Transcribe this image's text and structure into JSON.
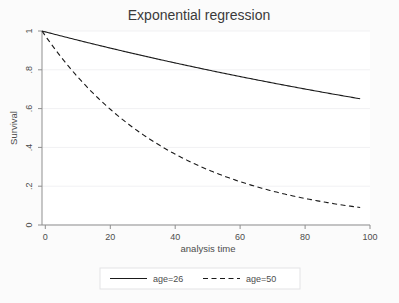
{
  "chart_data": {
    "type": "line",
    "title": "Exponential regression",
    "xlabel": "analysis time",
    "ylabel": "Survival",
    "xlim": [
      0,
      100
    ],
    "ylim": [
      0,
      1
    ],
    "xticks": [
      0,
      20,
      40,
      60,
      80,
      100
    ],
    "xtick_labels": [
      "0",
      "20",
      "40",
      "60",
      "80",
      "100"
    ],
    "yticks": [
      0,
      0.2,
      0.4,
      0.6,
      0.8,
      1
    ],
    "ytick_labels": [
      "0",
      ".2",
      ".4",
      ".6",
      ".8",
      "1"
    ],
    "grid": "horizontal",
    "legend_position": "bottom",
    "series": [
      {
        "name": "age=26",
        "style": "solid",
        "color": "#1a1a1a",
        "model": "exponential survival",
        "hazard": 0.00443,
        "x": [
          0,
          5,
          10,
          15,
          20,
          25,
          30,
          35,
          40,
          45,
          50,
          55,
          60,
          65,
          70,
          75,
          80,
          85,
          90,
          97
        ],
        "values": [
          1.0,
          0.978,
          0.957,
          0.936,
          0.915,
          0.895,
          0.876,
          0.857,
          0.838,
          0.82,
          0.802,
          0.784,
          0.767,
          0.75,
          0.734,
          0.718,
          0.702,
          0.687,
          0.672,
          0.65
        ]
      },
      {
        "name": "age=50",
        "style": "dashed",
        "color": "#1a1a1a",
        "model": "exponential survival",
        "hazard": 0.02481,
        "x": [
          0,
          5,
          10,
          15,
          20,
          25,
          30,
          35,
          40,
          45,
          50,
          55,
          60,
          65,
          70,
          75,
          80,
          85,
          90,
          97
        ],
        "values": [
          1.0,
          0.883,
          0.78,
          0.689,
          0.609,
          0.538,
          0.475,
          0.42,
          0.371,
          0.327,
          0.289,
          0.255,
          0.226,
          0.199,
          0.176,
          0.155,
          0.137,
          0.121,
          0.107,
          0.09
        ]
      }
    ]
  },
  "figure": {
    "title": "Exponential regression",
    "axes": {
      "x_title": "analysis time",
      "y_title": "Survival",
      "x_tick_labels": [
        "0",
        "20",
        "40",
        "60",
        "80",
        "100"
      ],
      "y_tick_labels": [
        "0",
        ".2",
        ".4",
        ".6",
        ".8",
        "1"
      ]
    },
    "legend": {
      "entries": [
        {
          "label": "age=26",
          "style": "solid"
        },
        {
          "label": "age=50",
          "style": "dashed"
        }
      ]
    },
    "colors": {
      "line": "#1a1a1a",
      "text": "#4d4d4d",
      "grid": "#f0f0f2",
      "axis": "#9a9a9a",
      "background": "#fbfbfb",
      "plot_background": "#ffffff"
    }
  }
}
